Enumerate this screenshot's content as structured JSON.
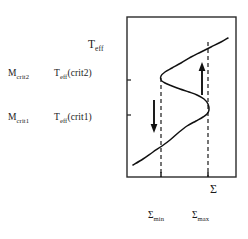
{
  "figure": {
    "caption_present": false
  },
  "annotations": {
    "rows": [
      {
        "mass_base": "M",
        "mass_sub": "crit2",
        "temp_base": "T",
        "temp_sub": "eff",
        "temp_arg": "(crit2)"
      },
      {
        "mass_base": "M",
        "mass_sub": "crit1",
        "temp_base": "T",
        "temp_sub": "eff",
        "temp_arg": "(crit1)"
      }
    ]
  },
  "axes": {
    "y_title_base": "T",
    "y_title_sub": "eff",
    "x_title": "Σ",
    "x_ticks": [
      {
        "base": "Σ",
        "sub": "min"
      },
      {
        "base": "Σ",
        "sub": "max"
      }
    ]
  },
  "chart_data": {
    "type": "line",
    "title": "",
    "xlabel": "Σ",
    "ylabel": "T_eff",
    "grid": false,
    "legend": null,
    "frame": {
      "x0": 127,
      "y0": 17,
      "x1": 236,
      "y1": 177
    },
    "xlim": [
      127,
      236
    ],
    "ylim": [
      177,
      17
    ],
    "curve_points": [
      [
        133,
        165
      ],
      [
        143,
        159
      ],
      [
        153,
        152
      ],
      [
        162,
        146
      ],
      [
        170,
        140
      ],
      [
        178,
        133
      ],
      [
        187,
        126
      ],
      [
        196,
        121
      ],
      [
        203,
        117
      ],
      [
        207,
        114
      ],
      [
        209,
        110
      ],
      [
        208,
        104
      ],
      [
        204,
        99
      ],
      [
        197,
        95
      ],
      [
        189,
        92
      ],
      [
        180,
        89
      ],
      [
        172,
        86
      ],
      [
        165,
        83
      ],
      [
        161,
        80
      ],
      [
        161,
        76
      ],
      [
        165,
        72
      ],
      [
        172,
        68
      ],
      [
        181,
        63
      ],
      [
        191,
        57
      ],
      [
        201,
        52
      ],
      [
        211,
        47
      ],
      [
        221,
        42
      ],
      [
        228,
        38
      ]
    ],
    "turning_points": [
      {
        "name": "upper_turning_point",
        "x": 161,
        "y": 78,
        "label": "Σ_min"
      },
      {
        "name": "lower_turning_point",
        "x": 208,
        "y": 114,
        "label": "Σ_max"
      }
    ],
    "dashed_verticals": [
      {
        "name": "sigma-min-dashed",
        "x": 161,
        "y_top": 78,
        "y_bottom": 177
      },
      {
        "name": "sigma-max-dashed",
        "x": 208,
        "y_top": 42,
        "y_bottom": 177
      }
    ],
    "arrows": [
      {
        "name": "down-arrow",
        "x": 154,
        "y_start": 100,
        "y_end": 133,
        "direction": "down"
      },
      {
        "name": "up-arrow",
        "x": 202,
        "y_start": 95,
        "y_end": 62,
        "direction": "up"
      }
    ],
    "y_axis_ticks_px": [
      80,
      115
    ],
    "x_axis_ticks_px": [
      161,
      208
    ]
  },
  "colors": {
    "ink": "#1a1a1a",
    "frame": "#2b2b2b",
    "curve": "#111111",
    "background": "#ffffff"
  }
}
